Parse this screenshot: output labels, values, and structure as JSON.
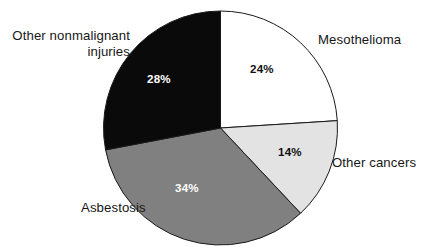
{
  "chart_data": {
    "type": "pie",
    "title": "",
    "subtitle": "",
    "xlabel": "",
    "ylabel": "",
    "legend_position": "none",
    "grid": false,
    "units": "percent",
    "total": 100,
    "start_angle_deg": 0,
    "direction": "clockwise",
    "categories": [
      "Mesothelioma",
      "Other cancers",
      "Asbestosis",
      "Other nonmalignant injuries"
    ],
    "values": [
      24,
      14,
      34,
      28
    ],
    "value_labels": [
      "24%",
      "14%",
      "34%",
      "28%"
    ],
    "slice_colors": [
      "#ffffff",
      "#e3e3e3",
      "#808080",
      "#0a0a0a"
    ],
    "slice_outline_color": "#1a1a1a",
    "label_text_colors": [
      "#111111",
      "#111111",
      "#ffffff",
      "#ffffff"
    ],
    "slices": [
      {
        "label": "Mesothelioma",
        "value": 24,
        "value_label": "24%",
        "fill": "#ffffff",
        "text_color": "#111111",
        "start_deg": 0,
        "end_deg": 86.4
      },
      {
        "label": "Other cancers",
        "value": 14,
        "value_label": "14%",
        "fill": "#e3e3e3",
        "text_color": "#111111",
        "start_deg": 86.4,
        "end_deg": 136.8
      },
      {
        "label": "Asbestosis",
        "value": 34,
        "value_label": "34%",
        "fill": "#808080",
        "text_color": "#ffffff",
        "start_deg": 136.8,
        "end_deg": 259.2
      },
      {
        "label": "Other nonmalignant injuries",
        "value": 28,
        "value_label": "28%",
        "fill": "#0a0a0a",
        "text_color": "#ffffff",
        "start_deg": 259.2,
        "end_deg": 360
      }
    ]
  },
  "labels": {
    "other_nonmalignant": "Other nonmalignant\ninjuries",
    "mesothelioma": "Mesothelioma",
    "other_cancers": "Other cancers",
    "asbestosis": "Asbestosis"
  },
  "percents": {
    "mesothelioma": "24%",
    "other_cancers": "14%",
    "asbestosis": "34%",
    "other_nonmalignant": "28%"
  }
}
